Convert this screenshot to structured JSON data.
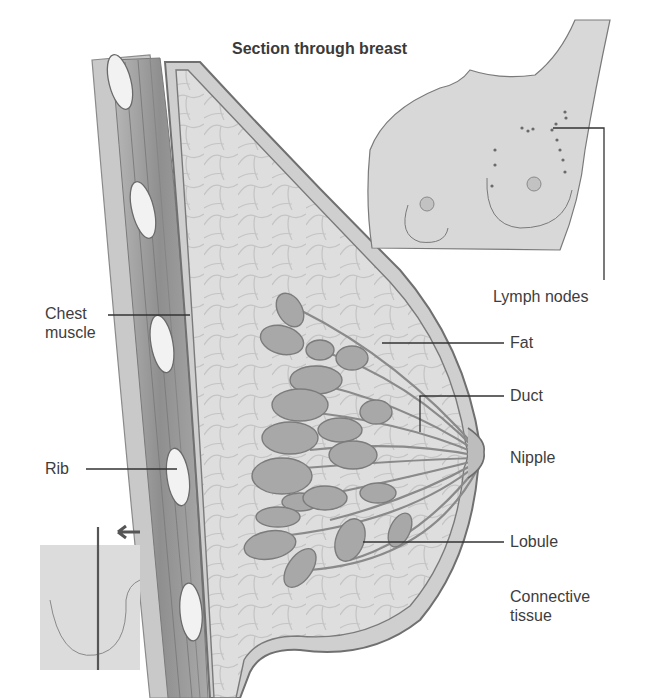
{
  "diagram": {
    "title": "Section through breast",
    "labels": {
      "chest_muscle": "Chest\nmuscle",
      "rib": "Rib",
      "lymph_nodes": "Lymph nodes",
      "fat": "Fat",
      "duct": "Duct",
      "nipple": "Nipple",
      "lobule": "Lobule",
      "connective_tissue": "Connective\ntissue"
    },
    "insets": {
      "torso_front_view": "front view of torso showing lymph node locations",
      "side_view_section_indicator": "side view with arrow indicating section plane"
    },
    "colors": {
      "background": "#ffffff",
      "tissue_fill": "#dcdcdc",
      "muscle_fill": "#9a9a9a",
      "lobule_fill": "#a6a6a6",
      "outline": "#6e6e6e",
      "leader_line": "#333333",
      "text": "#3d3d3d"
    }
  }
}
